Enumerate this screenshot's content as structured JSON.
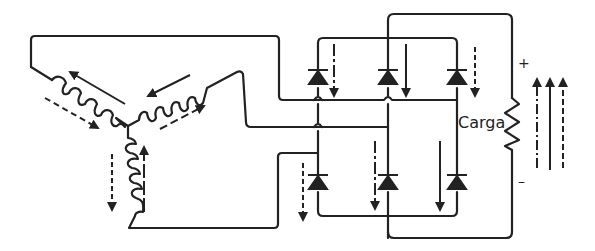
{
  "diagram": {
    "type": "three-phase-full-wave-bridge-rectifier",
    "line_color": "#222222",
    "background": "#ffffff",
    "source": {
      "connection": "wye",
      "windings": [
        {
          "id": "winding-left",
          "current_solid": "toward-outer",
          "current_dashed": "toward-center"
        },
        {
          "id": "winding-right",
          "current_solid": "toward-center",
          "current_dashed": "toward-outer"
        },
        {
          "id": "winding-bottom",
          "current_solid": "up",
          "current_dashed": "down"
        }
      ]
    },
    "bridge": {
      "diode_count": 6,
      "top_row": [
        {
          "id": "D1",
          "arrow": "dashed-down"
        },
        {
          "id": "D3",
          "arrow": "solid-down"
        },
        {
          "id": "D5",
          "arrow": "dashed-down"
        }
      ],
      "bottom_row": [
        {
          "id": "D4",
          "arrow": "dashed-down"
        },
        {
          "id": "D6",
          "arrow": "dashdot-down"
        },
        {
          "id": "D2",
          "arrow": "solid-down"
        }
      ]
    },
    "load": {
      "label": "Carga",
      "plus": "+",
      "minus": "–",
      "output_arrows": [
        "dash-dot-up",
        "solid-up",
        "dashed-up"
      ]
    }
  }
}
